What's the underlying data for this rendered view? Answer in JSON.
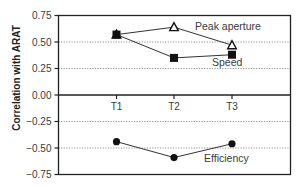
{
  "chart_data": {
    "type": "line",
    "title": "",
    "xlabel": "",
    "ylabel": "Correlation with ARAT",
    "categories": [
      "T1",
      "T2",
      "T3"
    ],
    "ylim": [
      -0.75,
      0.75
    ],
    "yticks": [
      "0.75",
      "0.50",
      "0.25",
      "0.00",
      "−0.25",
      "−0.50",
      "−0.75"
    ],
    "ytick_values": [
      0.75,
      0.5,
      0.25,
      0.0,
      -0.25,
      -0.5,
      -0.75
    ],
    "grid": "horizontal dotted at ±0.25, ±0.50",
    "legend": "none (inline series labels)",
    "series": [
      {
        "name": "Peak aperture",
        "marker": "open-triangle",
        "values": [
          0.57,
          0.64,
          0.47
        ]
      },
      {
        "name": "Speed",
        "marker": "filled-square",
        "values": [
          0.57,
          0.35,
          0.38
        ]
      },
      {
        "name": "Efficiency",
        "marker": "filled-circle",
        "values": [
          -0.44,
          -0.59,
          -0.46
        ]
      }
    ],
    "annotations": [
      {
        "text": "Peak aperture",
        "series": "Peak aperture"
      },
      {
        "text": "Speed",
        "series": "Speed"
      },
      {
        "text": "Efficiency",
        "series": "Efficiency"
      }
    ]
  },
  "colors": {
    "line": "#333333",
    "axis": "#222222",
    "grid": "#777777",
    "marker": "#111111"
  }
}
